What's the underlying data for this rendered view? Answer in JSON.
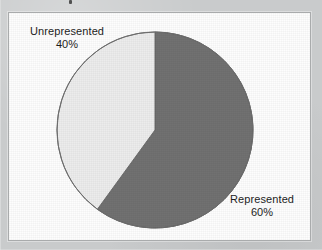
{
  "figure": {
    "background_color": "#c9cbcc",
    "panel_color": "#fdfdfd",
    "panel_border_color": "#a9abac"
  },
  "chart_data": {
    "type": "pie",
    "title": "",
    "subtitle": "",
    "xlabel": "",
    "ylabel": "",
    "grid": false,
    "legend_position": "none",
    "labels_position": "outside",
    "total": 100,
    "units": "%",
    "start_angle_deg": 0,
    "direction": "clockwise",
    "categories": [
      "Represented",
      "Unrepresented"
    ],
    "values": [
      60,
      40
    ],
    "slices": [
      {
        "label": "Represented",
        "value": 60,
        "value_text": "60%",
        "color": "#717171",
        "edge_color": "#4a4a4a",
        "start_angle_deg": 0,
        "end_angle_deg": 216
      },
      {
        "label": "Unrepresented",
        "value": 40,
        "value_text": "40%",
        "color": "#ececec",
        "edge_color": "#6b6b6b",
        "start_angle_deg": 216,
        "end_angle_deg": 360
      }
    ],
    "annotations": [
      {
        "name": "unrepresented-label",
        "text": "Unrepresented",
        "value_text": "40%"
      },
      {
        "name": "represented-label",
        "text": "Represented",
        "value_text": "60%"
      }
    ]
  },
  "labels": {
    "unrepresented": {
      "name": "Unrepresented",
      "percent": "40%"
    },
    "represented": {
      "name": "Represented",
      "percent": "60%"
    }
  }
}
